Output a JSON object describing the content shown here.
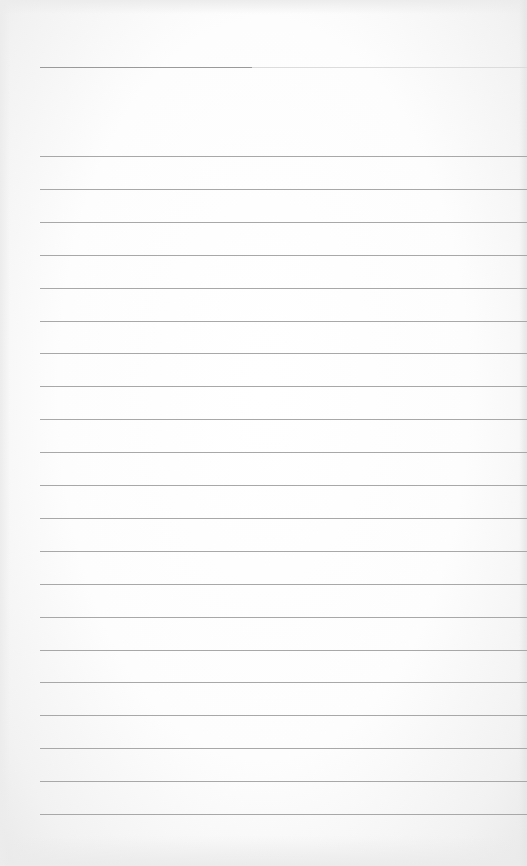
{
  "page": {
    "type": "lined-notebook-paper",
    "text": "",
    "header_rule": true,
    "body_rule_count": 21,
    "rule_color": "#a8a8a8",
    "header_rule_color": "#9a9a9a",
    "paper_color": "#ffffff"
  }
}
